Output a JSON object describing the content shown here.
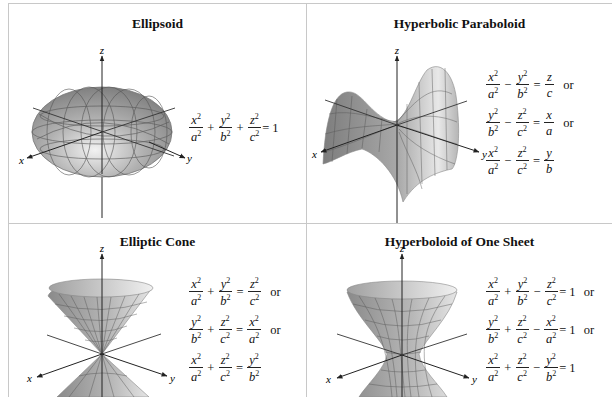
{
  "surfaces": [
    {
      "title": "Ellipsoid",
      "axes": {
        "x": "x",
        "y": "y",
        "z": "z"
      },
      "equations": [
        {
          "terms": [
            {
              "num": "x",
              "den": "a",
              "sq": true
            },
            {
              "op": "+"
            },
            {
              "num": "y",
              "den": "b",
              "sq": true
            },
            {
              "op": "+"
            },
            {
              "num": "z",
              "den": "c",
              "sq": true
            }
          ],
          "rhs": "= 1",
          "suffix": ""
        }
      ]
    },
    {
      "title": "Hyperbolic Paraboloid",
      "axes": {
        "x": "x",
        "y": "y",
        "z": "z"
      },
      "equations": [
        {
          "terms": [
            {
              "num": "x",
              "den": "a",
              "sq": true
            },
            {
              "op": "−"
            },
            {
              "num": "y",
              "den": "b",
              "sq": true
            },
            {
              "op": "="
            },
            {
              "num": "z",
              "den": "c",
              "sq": false
            }
          ],
          "rhs": "",
          "suffix": "or"
        },
        {
          "terms": [
            {
              "num": "y",
              "den": "b",
              "sq": true
            },
            {
              "op": "−"
            },
            {
              "num": "z",
              "den": "c",
              "sq": true
            },
            {
              "op": "="
            },
            {
              "num": "x",
              "den": "a",
              "sq": false
            }
          ],
          "rhs": "",
          "suffix": "or"
        },
        {
          "terms": [
            {
              "num": "x",
              "den": "a",
              "sq": true
            },
            {
              "op": "−"
            },
            {
              "num": "z",
              "den": "c",
              "sq": true
            },
            {
              "op": "="
            },
            {
              "num": "y",
              "den": "b",
              "sq": false
            }
          ],
          "rhs": "",
          "suffix": ""
        }
      ]
    },
    {
      "title": "Elliptic Cone",
      "axes": {
        "x": "x",
        "y": "y",
        "z": "z"
      },
      "equations": [
        {
          "terms": [
            {
              "num": "x",
              "den": "a",
              "sq": true
            },
            {
              "op": "+"
            },
            {
              "num": "y",
              "den": "b",
              "sq": true
            },
            {
              "op": "="
            },
            {
              "num": "z",
              "den": "c",
              "sq": true
            }
          ],
          "rhs": "",
          "suffix": "or"
        },
        {
          "terms": [
            {
              "num": "y",
              "den": "b",
              "sq": true
            },
            {
              "op": "+"
            },
            {
              "num": "z",
              "den": "c",
              "sq": true
            },
            {
              "op": "="
            },
            {
              "num": "x",
              "den": "a",
              "sq": true
            }
          ],
          "rhs": "",
          "suffix": "or"
        },
        {
          "terms": [
            {
              "num": "x",
              "den": "a",
              "sq": true
            },
            {
              "op": "+"
            },
            {
              "num": "z",
              "den": "c",
              "sq": true
            },
            {
              "op": "="
            },
            {
              "num": "y",
              "den": "b",
              "sq": true
            }
          ],
          "rhs": "",
          "suffix": ""
        }
      ]
    },
    {
      "title": "Hyperboloid of One Sheet",
      "axes": {
        "x": "x",
        "y": "y",
        "z": "z"
      },
      "equations": [
        {
          "terms": [
            {
              "num": "x",
              "den": "a",
              "sq": true
            },
            {
              "op": "+"
            },
            {
              "num": "y",
              "den": "b",
              "sq": true
            },
            {
              "op": "−"
            },
            {
              "num": "z",
              "den": "c",
              "sq": true
            }
          ],
          "rhs": "= 1",
          "suffix": "or"
        },
        {
          "terms": [
            {
              "num": "y",
              "den": "b",
              "sq": true
            },
            {
              "op": "+"
            },
            {
              "num": "z",
              "den": "c",
              "sq": true
            },
            {
              "op": "−"
            },
            {
              "num": "x",
              "den": "a",
              "sq": true
            }
          ],
          "rhs": "= 1",
          "suffix": "or"
        },
        {
          "terms": [
            {
              "num": "x",
              "den": "a",
              "sq": true
            },
            {
              "op": "+"
            },
            {
              "num": "z",
              "den": "c",
              "sq": true
            },
            {
              "op": "−"
            },
            {
              "num": "y",
              "den": "b",
              "sq": true
            }
          ],
          "rhs": "= 1",
          "suffix": ""
        }
      ]
    }
  ],
  "colors": {
    "border": "#c8c8c8",
    "surface_dark": "#8a8a8a",
    "surface_light": "#e6e6e6",
    "mesh": "#555555",
    "axis": "#222222"
  }
}
